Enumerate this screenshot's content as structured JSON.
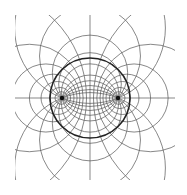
{
  "diagram": {
    "type": "bipolar coordinate / Apollonian circles line drawing",
    "foci": [
      {
        "x": 62,
        "y": 98
      },
      {
        "x": 118,
        "y": 98
      }
    ],
    "main_circle": {
      "cx": 90,
      "cy": 98,
      "r": 40
    },
    "line_color": "#555555",
    "thick_color": "#222222"
  }
}
